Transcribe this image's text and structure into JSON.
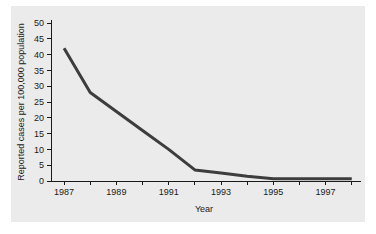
{
  "chart_data": {
    "type": "line",
    "title": "",
    "xlabel": "Year",
    "ylabel": "Reported cases per 100,000 population",
    "x": [
      1987,
      1988,
      1989,
      1990,
      1991,
      1992,
      1993,
      1994,
      1995,
      1996,
      1997,
      1998
    ],
    "values": [
      42,
      28,
      22,
      16,
      10,
      3.5,
      2.5,
      1.5,
      0.7,
      0.7,
      0.7,
      0.7
    ],
    "series": [
      {
        "name": "Reported cases per 100,000 population",
        "values": [
          42,
          28,
          22,
          16,
          10,
          3.5,
          2.5,
          1.5,
          0.7,
          0.7,
          0.7,
          0.7
        ]
      }
    ],
    "xlim": [
      1986.5,
      1998.2
    ],
    "ylim": [
      0,
      50
    ],
    "ytick_values": [
      0,
      5,
      10,
      15,
      20,
      25,
      30,
      35,
      40,
      45,
      50
    ],
    "ytick_labels": [
      "0",
      "5",
      "10",
      "15",
      "20",
      "25",
      "30",
      "35",
      "40",
      "45",
      "50"
    ],
    "xtick_values": [
      1987,
      1988,
      1989,
      1990,
      1991,
      1992,
      1993,
      1994,
      1995,
      1996,
      1997,
      1998
    ],
    "xtick_labels": [
      "1987",
      "",
      "1989",
      "",
      "1991",
      "",
      "1993",
      "",
      "1995",
      "",
      "1997",
      ""
    ],
    "grid": false,
    "legend": false,
    "legend_position": "none",
    "line_color": "#3d3d3d",
    "panel_color": "#ebebeb",
    "page_color": "#ffffff",
    "axis_color": "#1a1a1a"
  }
}
